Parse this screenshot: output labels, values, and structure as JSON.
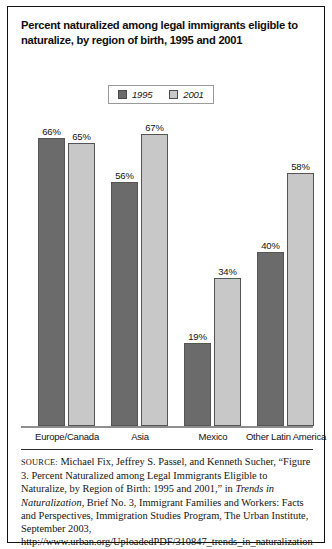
{
  "figure": {
    "title": "Percent naturalized among legal immigrants eligible to naturalize, by region of birth, 1995 and 2001"
  },
  "legend": {
    "entries": [
      {
        "label": "1995",
        "color": "#6b6b6b",
        "swatch_name": "legend-swatch-1995"
      },
      {
        "label": "2001",
        "color": "#c8c8c8",
        "swatch_name": "legend-swatch-2001"
      }
    ]
  },
  "source": {
    "label": "SOURCE:",
    "text_before_italic": " Michael Fix, Jeffrey S. Passel, and Kenneth Sucher, “Figure 3. Percent Naturalized among Legal Immigrants Eligible to Naturalize, by Region of Birth: 1995 and 2001,” in ",
    "italic_title": "Trends in Naturalization",
    "text_after_italic": ", Brief No. 3, Immigrant Families and Workers: Facts and Perspectives, Immigration Studies Program, The Urban Institute, September 2003, http://www.urban.org/UploadedPDF/310847_trends_in_naturalization .pdf (accessed February 3, 2005)"
  },
  "chart_data": {
    "type": "bar",
    "title": "Percent naturalized among legal immigrants eligible to naturalize, by region of birth, 1995 and 2001",
    "xlabel": "",
    "ylabel": "",
    "ylim": [
      0,
      72
    ],
    "grid": false,
    "legend_position": "top-center",
    "value_suffix": "%",
    "categories": [
      "Europe/Canada",
      "Asia",
      "Mexico",
      "Other Latin America"
    ],
    "series": [
      {
        "name": "1995",
        "color": "#6b6b6b",
        "values": [
          66,
          56,
          19,
          40
        ],
        "labels": [
          "66%",
          "56%",
          "19%",
          "40%"
        ]
      },
      {
        "name": "2001",
        "color": "#c8c8c8",
        "values": [
          65,
          67,
          34,
          58
        ],
        "labels": [
          "65%",
          "67%",
          "34%",
          "58%"
        ]
      }
    ]
  }
}
